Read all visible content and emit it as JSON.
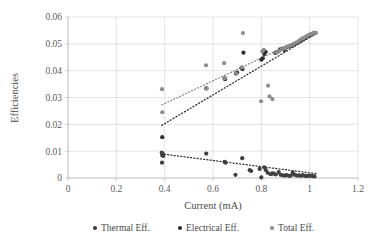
{
  "chart_data": {
    "type": "scatter",
    "title": "",
    "xlabel": "Current (mA)",
    "ylabel": "Efficiencies",
    "xlim": [
      0,
      1.2
    ],
    "ylim": [
      0,
      0.06
    ],
    "xticks": [
      0,
      0.2,
      0.4,
      0.6,
      0.8,
      1,
      1.2
    ],
    "xtick_labels": [
      "0",
      "0.2",
      "0.4",
      "0.6",
      "0.8",
      "1",
      "1.2"
    ],
    "yticks": [
      0,
      0.01,
      0.02,
      0.03,
      0.04,
      0.05,
      0.06
    ],
    "ytick_labels": [
      "0",
      "0.01",
      "0.02",
      "0.03",
      "0.04",
      "0.05",
      "0.06"
    ],
    "grid": "horizontal-and-vertical",
    "legend_position": "bottom",
    "marker_shape": "circle",
    "marker_size": 2.1,
    "series": [
      {
        "name": "Thermal Eff.",
        "color": "#3f3f3f",
        "points": [
          [
            0.388,
            0.0095
          ],
          [
            0.392,
            0.009
          ],
          [
            0.39,
            0.0085
          ],
          [
            0.394,
            0.0082
          ],
          [
            0.389,
            0.0057
          ],
          [
            0.572,
            0.0091
          ],
          [
            0.648,
            0.006
          ],
          [
            0.652,
            0.0057
          ],
          [
            0.693,
            0.0012
          ],
          [
            0.721,
            0.0074
          ],
          [
            0.752,
            0.0029
          ],
          [
            0.758,
            0.0026
          ],
          [
            0.793,
            0.0034
          ],
          [
            0.8,
            0.0002
          ],
          [
            0.812,
            0.004
          ],
          [
            0.818,
            0.003
          ],
          [
            0.826,
            0.002
          ],
          [
            0.838,
            0.0014
          ],
          [
            0.845,
            0.0017
          ],
          [
            0.852,
            0.0016
          ],
          [
            0.86,
            0.0013
          ],
          [
            0.872,
            0.0022
          ],
          [
            0.88,
            0.0012
          ],
          [
            0.89,
            0.001
          ],
          [
            0.898,
            0.0009
          ],
          [
            0.905,
            0.0011
          ],
          [
            0.915,
            0.0008
          ],
          [
            0.922,
            0.0009
          ],
          [
            0.93,
            0.002
          ],
          [
            0.938,
            0.0012
          ],
          [
            0.948,
            0.0009
          ],
          [
            0.956,
            0.001
          ],
          [
            0.964,
            0.0008
          ],
          [
            0.972,
            0.0011
          ],
          [
            0.98,
            0.0008
          ],
          [
            0.988,
            0.0007
          ],
          [
            0.996,
            0.0009
          ],
          [
            1.004,
            0.0008
          ],
          [
            1.012,
            0.0007
          ],
          [
            1.02,
            0.0006
          ]
        ]
      },
      {
        "name": "Electrical Eff.",
        "color": "#2e2e2e",
        "points": [
          [
            0.39,
            0.0152
          ],
          [
            0.572,
            0.0334
          ],
          [
            0.648,
            0.0371
          ],
          [
            0.65,
            0.0368
          ],
          [
            0.695,
            0.0389
          ],
          [
            0.7,
            0.0393
          ],
          [
            0.718,
            0.041
          ],
          [
            0.722,
            0.0406
          ],
          [
            0.726,
            0.0467
          ],
          [
            0.8,
            0.0441
          ],
          [
            0.806,
            0.0446
          ],
          [
            0.812,
            0.0462
          ],
          [
            0.818,
            0.047
          ],
          [
            0.858,
            0.0466
          ],
          [
            0.866,
            0.047
          ],
          [
            0.878,
            0.0479
          ],
          [
            0.886,
            0.0482
          ],
          [
            0.896,
            0.0477
          ],
          [
            0.906,
            0.0488
          ],
          [
            0.916,
            0.049
          ],
          [
            0.926,
            0.0494
          ],
          [
            0.936,
            0.0498
          ],
          [
            0.946,
            0.0503
          ],
          [
            0.956,
            0.0508
          ],
          [
            0.964,
            0.0512
          ],
          [
            0.972,
            0.0518
          ],
          [
            0.98,
            0.0521
          ],
          [
            0.988,
            0.0526
          ],
          [
            0.996,
            0.053
          ],
          [
            1.004,
            0.0533
          ],
          [
            1.012,
            0.0537
          ],
          [
            1.02,
            0.054
          ]
        ]
      },
      {
        "name": "Total Eff.",
        "color": "#8c8c8c",
        "points": [
          [
            0.389,
            0.0331
          ],
          [
            0.39,
            0.0245
          ],
          [
            0.571,
            0.042
          ],
          [
            0.574,
            0.0334
          ],
          [
            0.646,
            0.0428
          ],
          [
            0.649,
            0.0372
          ],
          [
            0.696,
            0.039
          ],
          [
            0.72,
            0.0412
          ],
          [
            0.724,
            0.054
          ],
          [
            0.799,
            0.0286
          ],
          [
            0.804,
            0.0472
          ],
          [
            0.81,
            0.0478
          ],
          [
            0.828,
            0.0344
          ],
          [
            0.834,
            0.0304
          ],
          [
            0.846,
            0.0294
          ],
          [
            0.862,
            0.0468
          ],
          [
            0.872,
            0.0472
          ],
          [
            0.884,
            0.048
          ],
          [
            0.894,
            0.0483
          ],
          [
            0.904,
            0.0489
          ],
          [
            0.914,
            0.0492
          ],
          [
            0.924,
            0.0496
          ],
          [
            0.934,
            0.05
          ],
          [
            0.944,
            0.0505
          ],
          [
            0.954,
            0.051
          ],
          [
            0.962,
            0.0516
          ],
          [
            0.97,
            0.052
          ],
          [
            0.978,
            0.0523
          ],
          [
            0.986,
            0.0528
          ],
          [
            0.994,
            0.0532
          ],
          [
            1.002,
            0.0535
          ],
          [
            1.01,
            0.0538
          ],
          [
            1.018,
            0.0542
          ],
          [
            1.026,
            0.0541
          ]
        ]
      }
    ],
    "trendlines": [
      {
        "name": "Thermal Eff. trend",
        "color": "#2e2e2e",
        "style": "dotted",
        "x_start": 0.385,
        "y_start": 0.009,
        "x_end": 1.03,
        "y_end": 0.0016
      },
      {
        "name": "Electrical Eff. trend",
        "color": "#2e2e2e",
        "style": "dotted",
        "x_start": 0.388,
        "y_start": 0.0196,
        "x_end": 1.03,
        "y_end": 0.054
      },
      {
        "name": "Total Eff. trend",
        "color": "#8c8c8c",
        "style": "dotted",
        "x_start": 0.388,
        "y_start": 0.0272,
        "x_end": 1.03,
        "y_end": 0.0545
      }
    ],
    "legend": [
      {
        "label": "Thermal Eff.",
        "color": "#3f3f3f"
      },
      {
        "label": "Electrical Eff.",
        "color": "#2e2e2e"
      },
      {
        "label": "Total Eff.",
        "color": "#8c8c8c"
      }
    ]
  },
  "plot_geometry": {
    "left": 68,
    "right": 358,
    "top": 17,
    "bottom": 178
  }
}
